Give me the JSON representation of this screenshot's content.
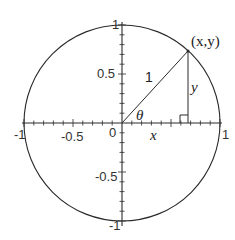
{
  "diagram": {
    "center_px": [
      122,
      123
    ],
    "radius_px": 98,
    "angle_deg": 47.5,
    "colors": {
      "stroke": "#2a2a2a",
      "background": "#ffffff",
      "text": "#333333"
    },
    "axes": {
      "x_ticks": [
        {
          "value": -1,
          "label": "-1"
        },
        {
          "value": -0.5,
          "label": "-0.5"
        },
        {
          "value": 0,
          "label": "0"
        },
        {
          "value": 1,
          "label": "1"
        }
      ],
      "y_ticks": [
        {
          "value": 1,
          "label": "1"
        },
        {
          "value": 0.5,
          "label": "0.5"
        },
        {
          "value": -0.5,
          "label": "-0.5"
        },
        {
          "value": -1,
          "label": "-1"
        }
      ],
      "minor_tick_step": 0.1
    },
    "labels": {
      "point": "(x,y)",
      "hypotenuse": "1",
      "angle": "θ",
      "adjacent": "x",
      "opposite": "y"
    }
  }
}
